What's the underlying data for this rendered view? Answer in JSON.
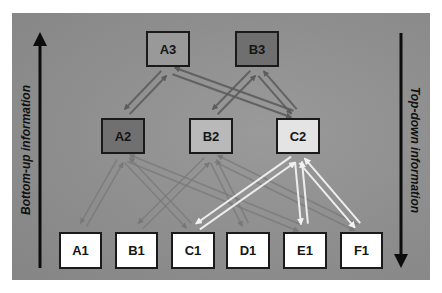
{
  "diagram": {
    "left_label": "Bottom-up information",
    "right_label": "Top-down information",
    "colors": {
      "background": "#8f8f8f",
      "level1_fill": "#ffffff",
      "A3_fill": "#999999",
      "B3_fill": "#6f6f6f",
      "A2_fill": "#707070",
      "B2_fill": "#b9b9b9",
      "C2_fill": "#e4e4e4",
      "dark_arrow": "#5c5c5c",
      "mid_arrow": "#787878",
      "light_arrow": "#f2f2f2",
      "axis_arrow": "#0d0d0d"
    },
    "nodes": {
      "A3": "A3",
      "B3": "B3",
      "A2": "A2",
      "B2": "B2",
      "C2": "C2",
      "A1": "A1",
      "B1": "B1",
      "C1": "C1",
      "D1": "D1",
      "E1": "E1",
      "F1": "F1"
    },
    "edges": [
      {
        "from": "A2",
        "to": "A3",
        "style": "dark"
      },
      {
        "from": "A3",
        "to": "A2",
        "style": "dark"
      },
      {
        "from": "C2",
        "to": "A3",
        "style": "dark"
      },
      {
        "from": "A3",
        "to": "C2",
        "style": "dark"
      },
      {
        "from": "B2",
        "to": "B3",
        "style": "dark"
      },
      {
        "from": "B3",
        "to": "B2",
        "style": "dark"
      },
      {
        "from": "C2",
        "to": "B3",
        "style": "dark"
      },
      {
        "from": "B3",
        "to": "C2",
        "style": "dark"
      },
      {
        "from": "A1",
        "to": "A2",
        "style": "mid"
      },
      {
        "from": "A2",
        "to": "A1",
        "style": "mid"
      },
      {
        "from": "C1",
        "to": "A2",
        "style": "mid"
      },
      {
        "from": "A2",
        "to": "C1",
        "style": "mid"
      },
      {
        "from": "E1",
        "to": "A2",
        "style": "mid"
      },
      {
        "from": "A2",
        "to": "E1",
        "style": "mid"
      },
      {
        "from": "B1",
        "to": "B2",
        "style": "mid"
      },
      {
        "from": "B2",
        "to": "B1",
        "style": "mid"
      },
      {
        "from": "D1",
        "to": "B2",
        "style": "mid"
      },
      {
        "from": "B2",
        "to": "D1",
        "style": "mid"
      },
      {
        "from": "F1",
        "to": "B2",
        "style": "mid"
      },
      {
        "from": "B2",
        "to": "F1",
        "style": "mid"
      },
      {
        "from": "C1",
        "to": "C2",
        "style": "light"
      },
      {
        "from": "C2",
        "to": "C1",
        "style": "light"
      },
      {
        "from": "E1",
        "to": "C2",
        "style": "light"
      },
      {
        "from": "C2",
        "to": "E1",
        "style": "light"
      },
      {
        "from": "F1",
        "to": "C2",
        "style": "light"
      },
      {
        "from": "C2",
        "to": "F1",
        "style": "light"
      }
    ]
  }
}
